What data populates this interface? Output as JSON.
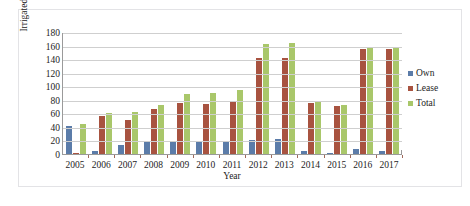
{
  "chart_data": {
    "type": "bar",
    "title": "",
    "xlabel": "Year",
    "ylabel": "Irrigated land (ha)",
    "ylim": [
      0,
      180
    ],
    "ytick_step": 20,
    "yticks": [
      180,
      160,
      140,
      120,
      100,
      80,
      60,
      40,
      20,
      0
    ],
    "grid": true,
    "legend_position": "right",
    "categories": [
      "2005",
      "2006",
      "2007",
      "2008",
      "2009",
      "2010",
      "2011",
      "2012",
      "2013",
      "2014",
      "2015",
      "2016",
      "2017"
    ],
    "series": [
      {
        "name": "Own",
        "color": "#5b7ca9",
        "values": [
          41,
          5,
          13,
          18,
          18,
          19,
          18,
          20,
          22,
          5,
          1,
          7,
          5
        ]
      },
      {
        "name": "Lease",
        "color": "#a85340",
        "values": [
          2,
          56,
          50,
          67,
          75,
          74,
          78,
          142,
          142,
          76,
          71,
          155,
          155
        ]
      },
      {
        "name": "Total",
        "color": "#a9c76a",
        "values": [
          44,
          60,
          62,
          73,
          89,
          90,
          94,
          163,
          164,
          77,
          73,
          157,
          157
        ]
      }
    ]
  },
  "legend": {
    "items": [
      {
        "label": "Own"
      },
      {
        "label": "Lease"
      },
      {
        "label": "Total"
      }
    ]
  }
}
